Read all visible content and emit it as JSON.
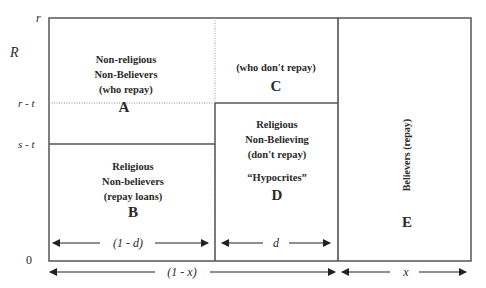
{
  "axis": {
    "y_ticks": {
      "r": "r",
      "R": "R",
      "r_minus_t": "r - t",
      "s_minus_t": "s - t",
      "zero": "0"
    }
  },
  "regions": {
    "A": {
      "line1": "Non-religious",
      "line2": "Non-Believers",
      "line3": "(who repay)",
      "letter": "A"
    },
    "C": {
      "line1": "(who don't repay)",
      "letter": "C"
    },
    "B": {
      "line1": "Religious",
      "line2": "Non-believers",
      "line3": "(repay loans)",
      "letter": "B"
    },
    "D": {
      "line1": "Religious",
      "line2": "Non-Believing",
      "line3": "(don't repay)",
      "line4": "“Hypocrites”",
      "letter": "D"
    },
    "E": {
      "vertical_label": "Believers (repay)",
      "letter": "E"
    }
  },
  "widths": {
    "one_minus_d": "(1 - d)",
    "d": "d",
    "one_minus_x": "(1 - x)",
    "x": "x"
  },
  "colors": {
    "line": "#555555",
    "text": "#2a2a2a",
    "background": "#ffffff"
  }
}
